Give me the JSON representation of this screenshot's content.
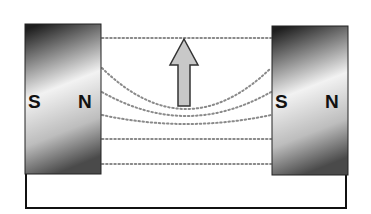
{
  "diagram": {
    "left_magnet": {
      "left_pole": "S",
      "right_pole": "N"
    },
    "right_magnet": {
      "left_pole": "S",
      "right_pole": "N"
    },
    "force_arrow": {
      "direction": "up",
      "fill": "#c8c8c8",
      "stroke": "#333333"
    },
    "field_lines": {
      "count": 6,
      "style": "dotted",
      "color": "#8a8a8a"
    },
    "colors": {
      "magnet_dark": "#2a2a2a",
      "magnet_light": "#f4f4f4",
      "wire": "#111111"
    }
  }
}
